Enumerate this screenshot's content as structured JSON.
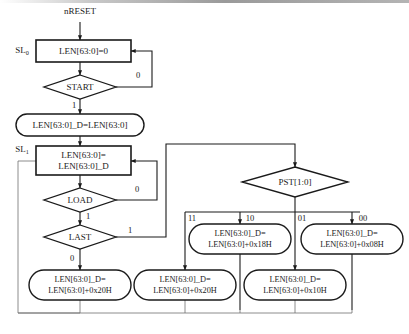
{
  "diagram": {
    "entry_signal": "nRESET",
    "state_labels": {
      "sl0": {
        "base": "SL",
        "sub": "0"
      },
      "sl1": {
        "base": "SL",
        "sub": "1"
      }
    },
    "nodes": {
      "reset_state": {
        "text": "LEN[63:0]=0",
        "shape": "rect"
      },
      "start_decision": {
        "text": "START",
        "shape": "diamond"
      },
      "load_d_from_len": {
        "text": "LEN[63:0]_D=LEN[63:0]",
        "shape": "rounded"
      },
      "run_state_line1": "LEN[63:0]=",
      "run_state_line2": "LEN[63:0]_D",
      "load_decision": {
        "text": "LOAD",
        "shape": "diamond"
      },
      "last_decision": {
        "text": "LAST",
        "shape": "diamond"
      },
      "pst_decision": {
        "text": "PST[1:0]",
        "shape": "diamond"
      },
      "op_last0": {
        "line1": "LEN[63:0]_D=",
        "line2": "LEN[63:0]+0x20H",
        "shape": "rounded"
      },
      "op_pst11": {
        "line1": "LEN[63:0]_D=",
        "line2": "LEN[63:0]+0x20H",
        "shape": "rounded"
      },
      "op_pst10": {
        "line1": "LEN[63:0]_D=",
        "line2": "LEN[63:0]+0x18H",
        "shape": "rounded"
      },
      "op_pst01": {
        "line1": "LEN[63:0]_D=",
        "line2": "LEN[63:0]+0x10H",
        "shape": "rounded"
      },
      "op_pst00": {
        "line1": "LEN[63:0]_D=",
        "line2": "LEN[63:0]+0x08H",
        "shape": "rounded"
      }
    },
    "edge_labels": {
      "start_false": "0",
      "start_true": "1",
      "load_false": "0",
      "load_true": "1",
      "last_true": "1",
      "last_false": "0",
      "pst_11": "11",
      "pst_10": "10",
      "pst_01": "01",
      "pst_00": "00"
    },
    "colors": {
      "line": "#1a1a1a",
      "fill": "#ffffff",
      "bus": "#6f6f6f"
    }
  }
}
